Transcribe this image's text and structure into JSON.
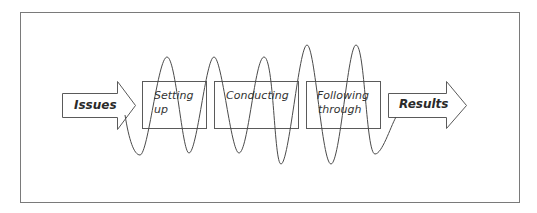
{
  "diagram": {
    "colors": {
      "stroke": "#5a5a5a",
      "frame": "#7a7a7a",
      "text": "#333333",
      "background": "#ffffff"
    },
    "input_arrow": {
      "label": "Issues"
    },
    "stages": [
      {
        "line1": "Setting",
        "line2": "up"
      },
      {
        "line1": "Conducting",
        "line2": ""
      },
      {
        "line1": "Following",
        "line2": "through"
      }
    ],
    "output_arrow": {
      "label": "Results"
    },
    "wave": {
      "description": "sinusoidal line weaving through the stage boxes from Issues to Results",
      "peaks": 5,
      "troughs": 6
    }
  }
}
